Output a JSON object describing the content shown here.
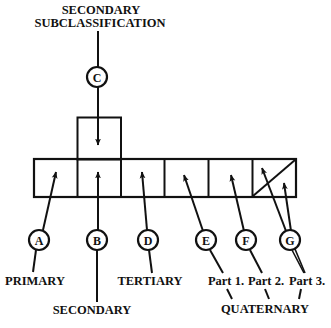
{
  "diagram": {
    "colors": {
      "ink": "#111111",
      "background": "#ffffff"
    },
    "top_label": {
      "line1": "SECONDARY",
      "line2": "SUBCLASSIFICATION"
    },
    "circles": {
      "A": "A",
      "B": "B",
      "C": "C",
      "D": "D",
      "E": "E",
      "F": "F",
      "G": "G"
    },
    "bottom_labels": {
      "primary": "PRIMARY",
      "secondary": "SECONDARY",
      "tertiary": "TERTIARY",
      "part1": "Part 1.",
      "part2": "Part 2.",
      "part3": "Part 3.",
      "quaternary": "QUATERNARY"
    },
    "cells": [
      "primary",
      "secondary",
      "tertiary",
      "quaternary-part-1",
      "quaternary-part-2",
      "quaternary-part-3"
    ]
  }
}
